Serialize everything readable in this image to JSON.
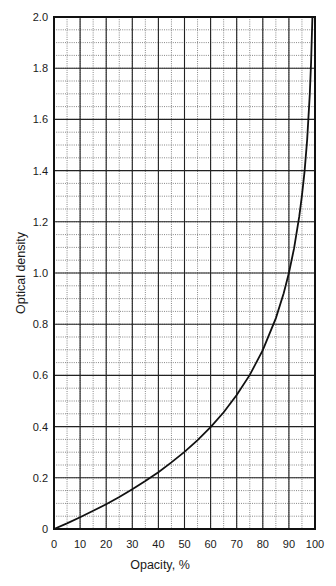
{
  "chart_data": {
    "type": "line",
    "title": "",
    "xlabel": "Opacity, %",
    "ylabel": "Optical density",
    "xlim": [
      0,
      100
    ],
    "ylim": [
      0,
      2.0
    ],
    "grid": true,
    "grid_major": {
      "x_step": 10,
      "y_step": 0.2,
      "style": "solid"
    },
    "grid_minor": {
      "x_step": 5,
      "y_step": 0.05,
      "style": "dotted"
    },
    "legend": null,
    "x_ticks": [
      "0",
      "10",
      "20",
      "30",
      "40",
      "50",
      "60",
      "70",
      "80",
      "90",
      "100"
    ],
    "y_ticks": [
      "0",
      "0.2",
      "0.4",
      "0.6",
      "0.8",
      "1.0",
      "1.2",
      "1.4",
      "1.6",
      "1.8",
      "2.0"
    ],
    "series": [
      {
        "name": "Optical density vs opacity",
        "x": [
          0,
          5,
          10,
          15,
          20,
          25,
          30,
          35,
          40,
          45,
          50,
          55,
          60,
          65,
          70,
          75,
          80,
          85,
          88,
          90,
          92,
          94,
          95,
          96,
          97,
          98,
          98.5,
          99
        ],
        "y": [
          0,
          0.022,
          0.046,
          0.071,
          0.097,
          0.125,
          0.155,
          0.187,
          0.222,
          0.26,
          0.301,
          0.347,
          0.398,
          0.456,
          0.523,
          0.602,
          0.699,
          0.824,
          0.921,
          1.0,
          1.097,
          1.222,
          1.301,
          1.398,
          1.523,
          1.699,
          1.824,
          2.0
        ]
      }
    ]
  }
}
